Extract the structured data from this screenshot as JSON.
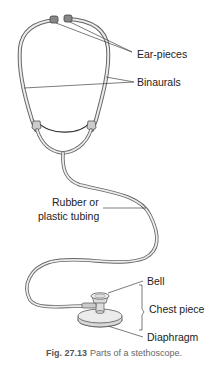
{
  "figure": {
    "title": "Parts of a stethoscope",
    "caption": {
      "number": "Fig. 27.13",
      "text": "Parts of a stethoscope."
    },
    "labels": {
      "ear_pieces": "Ear-pieces",
      "binaurals": "Binaurals",
      "tubing_line1": "Rubber or",
      "tubing_line2": "plastic tubing",
      "bell": "Bell",
      "chest_piece": "Chest piece",
      "diaphragm": "Diaphragm"
    },
    "colors": {
      "outline": "#555555",
      "fill": "#e6e6e6",
      "dark": "#333333",
      "leader": "#444444"
    }
  }
}
